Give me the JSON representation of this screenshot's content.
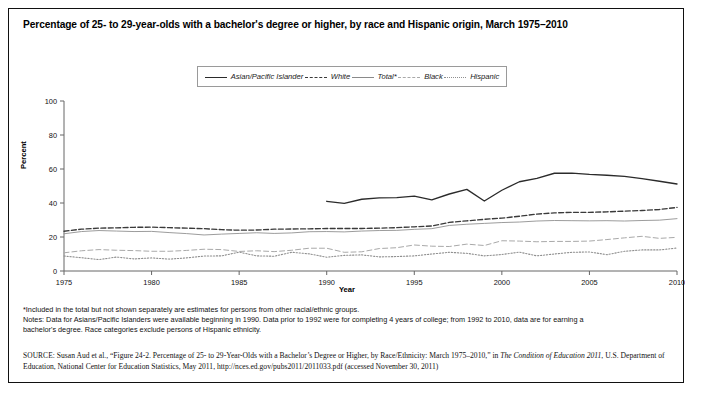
{
  "figure": {
    "title": "Percentage of 25- to 29-year-olds with a bachelor's degree or higher, by race and Hispanic origin, March 1975–2010"
  },
  "notes": {
    "line1": "*Included in the total but not shown separately are estimates for persons from other racial/ethnic groups.",
    "line2": "Notes: Data for Asians/Pacific Islanders were available beginning in 1990. Data prior to 1992 were for completing 4 years of college; from 1992 to 2010, data are for earning a",
    "line3": "bachelor's degree. Race categories exclude persons of Hispanic ethnicity."
  },
  "source": {
    "label": "SOURCE:",
    "text_part1": " Susan Aud et al., “Figure 24-2. Percentage of 25- to 29-Year-Olds with a Bachelor’s Degree or Higher, by Race/Ethnicity: March 1975–2010,” in ",
    "italic_title": "The Condition of Education 2011",
    "text_part2": ", U.S. Department of Education, National Center for Education Statistics, May 2011, http://nces.ed.gov/pubs2011/2011033.pdf (accessed November 30, 2011)"
  },
  "chart_data": {
    "type": "line",
    "title": "Percentage of 25- to 29-year-olds with a bachelor's degree or higher, by race and Hispanic origin, March 1975–2010",
    "xlabel": "Year",
    "ylabel": "Percent",
    "xlim": [
      1975,
      2010
    ],
    "ylim": [
      0,
      100
    ],
    "yticks": [
      0,
      20,
      40,
      60,
      80,
      100
    ],
    "xticks": [
      1975,
      1980,
      1985,
      1990,
      1995,
      2000,
      2005,
      2010
    ],
    "grid": false,
    "legend_position": "top-center",
    "x": [
      1975,
      1976,
      1977,
      1978,
      1979,
      1980,
      1981,
      1982,
      1983,
      1984,
      1985,
      1986,
      1987,
      1988,
      1989,
      1990,
      1991,
      1992,
      1993,
      1994,
      1995,
      1996,
      1997,
      1998,
      1999,
      2000,
      2001,
      2002,
      2003,
      2004,
      2005,
      2006,
      2007,
      2008,
      2009,
      2010
    ],
    "series": [
      {
        "name": "Asian/Pacific Islander",
        "style": "solid-thick",
        "color": "#2b2b2b",
        "start_year": 1990,
        "values": [
          null,
          null,
          null,
          null,
          null,
          null,
          null,
          null,
          null,
          null,
          null,
          null,
          null,
          null,
          null,
          41.0,
          39.8,
          42.2,
          43.0,
          43.2,
          44.0,
          41.8,
          45.3,
          48.0,
          41.2,
          47.5,
          52.5,
          54.5,
          57.5,
          57.6,
          56.8,
          56.3,
          55.7,
          54.3,
          52.8,
          51.2
        ]
      },
      {
        "name": "White",
        "style": "dashed",
        "color": "#3a3a3a",
        "values": [
          23.4,
          24.6,
          25.2,
          25.4,
          25.7,
          25.8,
          25.5,
          25.2,
          24.9,
          24.3,
          24.0,
          24.1,
          24.6,
          24.7,
          24.8,
          25.0,
          25.0,
          25.0,
          25.2,
          25.5,
          26.0,
          26.5,
          28.6,
          29.5,
          30.4,
          31.1,
          32.2,
          33.5,
          34.2,
          34.5,
          34.5,
          34.8,
          35.2,
          35.6,
          36.2,
          37.4
        ]
      },
      {
        "name": "Total*",
        "style": "solid-thin",
        "color": "#8a8a8a",
        "values": [
          21.9,
          23.2,
          23.8,
          23.5,
          23.2,
          23.3,
          22.6,
          22.0,
          21.2,
          21.7,
          22.1,
          22.5,
          22.1,
          22.4,
          23.1,
          23.2,
          23.0,
          23.5,
          23.8,
          23.9,
          24.5,
          24.9,
          26.8,
          27.5,
          28.0,
          28.5,
          28.8,
          29.4,
          29.7,
          29.6,
          29.5,
          29.6,
          29.4,
          29.7,
          29.9,
          30.8
        ]
      },
      {
        "name": "Black",
        "style": "dash-light",
        "color": "#a9a9a9",
        "values": [
          10.7,
          11.9,
          12.6,
          12.2,
          12.0,
          11.6,
          11.6,
          12.1,
          12.8,
          12.6,
          11.5,
          11.9,
          11.4,
          12.2,
          13.4,
          13.4,
          11.0,
          11.3,
          13.2,
          13.7,
          15.3,
          14.6,
          14.4,
          15.8,
          15.0,
          17.8,
          17.6,
          17.2,
          17.4,
          17.4,
          17.6,
          18.5,
          19.5,
          20.4,
          19.2,
          19.8
        ]
      },
      {
        "name": "Hispanic",
        "style": "dotted",
        "color": "#8f8f8f",
        "values": [
          8.8,
          7.8,
          6.7,
          8.2,
          7.1,
          7.7,
          7.0,
          7.7,
          8.8,
          8.9,
          11.1,
          8.9,
          8.7,
          11.0,
          10.1,
          8.1,
          9.2,
          9.5,
          8.3,
          8.5,
          8.9,
          10.0,
          11.0,
          10.4,
          8.9,
          9.7,
          11.1,
          8.9,
          10.0,
          11.0,
          11.2,
          9.6,
          11.6,
          12.4,
          12.4,
          13.5
        ]
      }
    ]
  },
  "axes": {
    "y_title": "Percent",
    "x_title": "Year"
  }
}
